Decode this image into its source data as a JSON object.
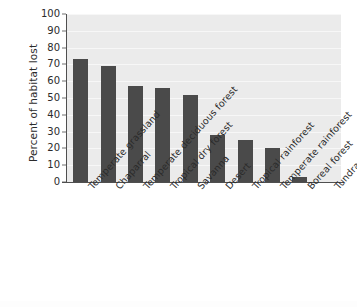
{
  "chart_data": {
    "type": "bar",
    "title": "",
    "subtitle": "",
    "xlabel": "",
    "ylabel": "Percent of habitat lost",
    "ylim": [
      0,
      100
    ],
    "ytick_step": 10,
    "yticks": [
      100,
      90,
      80,
      70,
      60,
      50,
      40,
      30,
      20,
      10,
      0
    ],
    "grid": "horizontal",
    "legend": "none",
    "orientation": "vertical",
    "bar_color": "#4a4a4a",
    "plot_background": "#ebebeb",
    "gridline_color": "#f7f7f7",
    "axis_color": "#4f4f4f",
    "page_background": "#ffffff",
    "xtick_rotation_degrees": -48,
    "categories": [
      "Temperate grassland",
      "Chaparral",
      "Temperate deciduous forest",
      "Tropical dry forest",
      "Savanna",
      "Desert",
      "Tropical rainforest",
      "Temperate rainforest",
      "Boreal forest",
      "Tundra"
    ],
    "values": [
      73,
      69,
      57,
      56,
      52,
      28,
      25,
      20.5,
      3,
      0
    ]
  }
}
